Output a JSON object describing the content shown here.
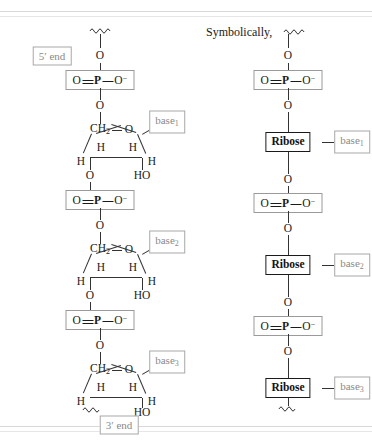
{
  "figure": {
    "title_text": "Symbolically,",
    "end_labels": {
      "five_prime": "5′ end",
      "three_prime": "3′ end"
    },
    "atoms": {
      "oxygen": "O",
      "hydrogen": "H",
      "hydroxyl": "HO",
      "methylene": "CH",
      "methylene_sub": "2",
      "phosphorus": "P",
      "oxygen_anion_sup": "−"
    },
    "phosphate_group": {
      "left_oxygen": "O",
      "center_atom": "P",
      "right_oxygen": "O",
      "charge": "−",
      "label": "O=P—O⁻"
    },
    "ribose_label": "Ribose",
    "bases": [
      {
        "label": "base",
        "sub": "1"
      },
      {
        "label": "base",
        "sub": "2"
      },
      {
        "label": "base",
        "sub": "3"
      }
    ],
    "colors": {
      "ink": "#1a1a1a",
      "bond": "#333333",
      "gray_label": "#8a8a86",
      "gray_border": "#a8a8a8",
      "phosphate_border": "#9a9a9a",
      "ribose_border": "#1a1a1a",
      "rule": "#d8d8d8",
      "background": "#ffffff"
    },
    "structure": {
      "type": "rna-polynucleotide-chain",
      "left_column": "detailed ribose ring structures",
      "right_column": "symbolic Ribose boxes",
      "repeat_units": 3
    }
  }
}
